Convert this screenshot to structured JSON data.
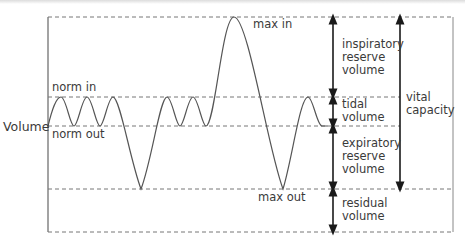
{
  "diagram": {
    "axis_label": "Volume",
    "levels": {
      "max_in": "max in",
      "norm_in": "norm in",
      "norm_out": "norm out",
      "max_out": "max out"
    },
    "volumes": [
      {
        "id": "irv",
        "line1": "inspiratory",
        "line2": "reserve",
        "line3": "volume"
      },
      {
        "id": "tidal",
        "line1": "tidal",
        "line2": "volume"
      },
      {
        "id": "erv",
        "line1": "expiratory",
        "line2": "reserve",
        "line3": "volume"
      },
      {
        "id": "residual",
        "line1": "residual",
        "line2": "volume"
      }
    ],
    "vital_capacity": {
      "line1": "vital",
      "line2": "capacity"
    },
    "colors": {
      "line": "#555555",
      "dashed": "#777777",
      "arrow": "#1a1a1a",
      "text": "#3a3a3a"
    }
  }
}
